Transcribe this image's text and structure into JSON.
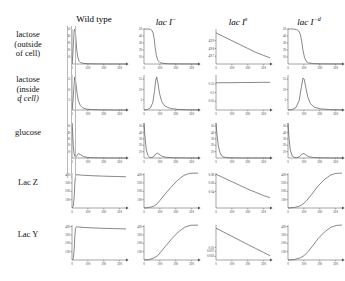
{
  "figure": {
    "columns": [
      {
        "label": "Wild type",
        "italic": false,
        "sup": ""
      },
      {
        "label": "lac I",
        "italic": true,
        "sup": "−"
      },
      {
        "label": "lac I",
        "italic": true,
        "sup": "s"
      },
      {
        "label": "lac I",
        "italic": true,
        "sup": "−d"
      }
    ],
    "rows": [
      {
        "lines": [
          "lactose",
          "(outside",
          "of cell)"
        ],
        "italic_line": -1
      },
      {
        "lines": [
          "lactose",
          "(inside",
          "ɖ cell)"
        ],
        "italic_line": 2
      },
      {
        "lines": [
          "glucose"
        ],
        "italic_line": -1
      },
      {
        "lines": [
          "Lac Z"
        ],
        "italic_line": -1
      },
      {
        "lines": [
          "Lac Y"
        ],
        "italic_line": -1
      }
    ],
    "xaxis": {
      "ticks": [
        100,
        200,
        300
      ],
      "min": 0,
      "max": 340
    },
    "colors": {
      "axis": "#4a4a4a",
      "curve": "#555555",
      "guide": "#b9b9b9"
    }
  },
  "chart_data": [
    {
      "type": "line",
      "row": "lactose (outside of cell)",
      "column": "Wild type",
      "title": "",
      "xlabel": "",
      "ylabel": "",
      "xlim": [
        0,
        340
      ],
      "ylim": [
        0,
        50
      ],
      "grid": false,
      "yticks": [
        10,
        20,
        30,
        40,
        50
      ],
      "xticks": [
        100,
        200,
        300
      ],
      "x": [
        0,
        5,
        10,
        14,
        18,
        22,
        26,
        30,
        36,
        44,
        55,
        70,
        100,
        160,
        230,
        300,
        340
      ],
      "y": [
        0,
        12,
        34,
        48,
        50,
        44,
        32,
        20,
        10,
        4.5,
        2,
        1,
        0.4,
        0.15,
        0.05,
        0.02,
        0.01
      ]
    },
    {
      "type": "line",
      "row": "lactose (outside of cell)",
      "column": "lac I−",
      "title": "",
      "xlabel": "",
      "ylabel": "",
      "xlim": [
        0,
        340
      ],
      "ylim": [
        0,
        50
      ],
      "grid": false,
      "yticks": [
        10,
        20,
        30,
        40,
        50
      ],
      "xticks": [
        100,
        200,
        300
      ],
      "x": [
        0,
        10,
        25,
        40,
        50,
        58,
        64,
        70,
        78,
        88,
        100,
        120,
        160,
        230,
        300,
        340
      ],
      "y": [
        50,
        50,
        50,
        49.5,
        48,
        44,
        36,
        24,
        12,
        5,
        2,
        0.8,
        0.3,
        0.1,
        0.05,
        0.02
      ]
    },
    {
      "type": "line",
      "row": "lactose (outside of cell)",
      "column": "lac I s",
      "title": "",
      "xlabel": "",
      "ylabel": "",
      "xlim": [
        0,
        340
      ],
      "ylim": [
        49.6,
        50.05
      ],
      "grid": false,
      "yticks": [
        49.7,
        49.8,
        49.9
      ],
      "xticks": [
        100,
        200,
        300
      ],
      "x": [
        0,
        50,
        100,
        150,
        200,
        250,
        300,
        340
      ],
      "y": [
        50.0,
        49.95,
        49.9,
        49.85,
        49.8,
        49.75,
        49.71,
        49.68
      ]
    },
    {
      "type": "line",
      "row": "lactose (outside of cell)",
      "column": "lac I −d",
      "title": "",
      "xlabel": "",
      "ylabel": "",
      "xlim": [
        0,
        340
      ],
      "ylim": [
        0,
        50
      ],
      "grid": false,
      "yticks": [
        10,
        20,
        30,
        40,
        50
      ],
      "xticks": [
        100,
        200,
        300
      ],
      "x": [
        0,
        15,
        35,
        55,
        68,
        78,
        86,
        94,
        104,
        116,
        130,
        160,
        210,
        270,
        340
      ],
      "y": [
        50,
        50,
        50,
        49,
        47,
        42,
        33,
        20,
        9,
        3.5,
        1.5,
        0.6,
        0.2,
        0.08,
        0.03
      ]
    },
    {
      "type": "line",
      "row": "lactose (inside of cell)",
      "column": "Wild type",
      "title": "",
      "xlabel": "",
      "ylabel": "",
      "xlim": [
        0,
        340
      ],
      "ylim": [
        0,
        17
      ],
      "grid": false,
      "yticks": [
        5,
        10,
        15
      ],
      "xticks": [
        100,
        200,
        300
      ],
      "x": [
        0,
        6,
        12,
        17,
        21,
        26,
        32,
        40,
        52,
        68,
        90,
        130,
        190,
        260,
        340
      ],
      "y": [
        0,
        4,
        11,
        16,
        15,
        12,
        8,
        4.5,
        2.2,
        1.0,
        0.45,
        0.18,
        0.07,
        0.03,
        0.01
      ]
    },
    {
      "type": "line",
      "row": "lactose (inside of cell)",
      "column": "lac I−",
      "title": "",
      "xlabel": "",
      "ylabel": "",
      "xlim": [
        0,
        340
      ],
      "ylim": [
        0,
        17
      ],
      "grid": false,
      "yticks": [
        5,
        10,
        15
      ],
      "xticks": [
        100,
        200,
        300
      ],
      "x": [
        0,
        20,
        40,
        55,
        66,
        74,
        80,
        88,
        98,
        112,
        130,
        160,
        210,
        270,
        340
      ],
      "y": [
        0,
        0.2,
        1.0,
        3.5,
        9,
        14.5,
        16,
        13,
        8,
        4,
        2,
        0.9,
        0.3,
        0.12,
        0.05
      ]
    },
    {
      "type": "line",
      "row": "lactose (inside of cell)",
      "column": "lac I s",
      "title": "",
      "xlabel": "",
      "ylabel": "",
      "xlim": [
        0,
        340
      ],
      "ylim": [
        0,
        0.2
      ],
      "grid": false,
      "yticks": [
        0.05,
        0.1,
        0.15
      ],
      "xticks": [
        100,
        200,
        300
      ],
      "x": [
        0,
        40,
        100,
        160,
        220,
        280,
        340
      ],
      "y": [
        0.155,
        0.156,
        0.156,
        0.157,
        0.157,
        0.158,
        0.158
      ]
    },
    {
      "type": "line",
      "row": "lactose (inside of cell)",
      "column": "lac I −d",
      "title": "",
      "xlabel": "",
      "ylabel": "",
      "xlim": [
        0,
        340
      ],
      "ylim": [
        0,
        17
      ],
      "grid": false,
      "yticks": [
        5,
        10,
        15
      ],
      "xticks": [
        100,
        200,
        300
      ],
      "x": [
        0,
        25,
        50,
        70,
        84,
        94,
        102,
        112,
        124,
        140,
        165,
        205,
        260,
        340
      ],
      "y": [
        0,
        0.2,
        1.2,
        4.5,
        11,
        15.5,
        15,
        11,
        6.5,
        3.2,
        1.4,
        0.55,
        0.2,
        0.07
      ]
    },
    {
      "type": "line",
      "row": "glucose",
      "column": "Wild type",
      "title": "",
      "xlabel": "",
      "ylabel": "",
      "xlim": [
        0,
        340
      ],
      "ylim": [
        0,
        55
      ],
      "grid": false,
      "yticks": [
        10,
        20,
        30,
        40,
        50
      ],
      "xticks": [
        100,
        200,
        300
      ],
      "x": [
        0,
        4,
        8,
        12,
        18,
        24,
        30,
        40,
        55,
        75,
        100,
        140,
        200,
        270,
        340
      ],
      "y": [
        55,
        40,
        20,
        8,
        2.5,
        1.2,
        3.5,
        7,
        5,
        2,
        0.8,
        0.3,
        0.1,
        0.05,
        0.02
      ]
    },
    {
      "type": "line",
      "row": "glucose",
      "column": "lac I−",
      "title": "",
      "xlabel": "",
      "ylabel": "",
      "xlim": [
        0,
        340
      ],
      "ylim": [
        0,
        55
      ],
      "grid": false,
      "yticks": [
        10,
        20,
        30,
        40,
        50
      ],
      "xticks": [
        100,
        200,
        300
      ],
      "x": [
        0,
        6,
        14,
        24,
        36,
        50,
        62,
        74,
        86,
        100,
        118,
        145,
        190,
        260,
        340
      ],
      "y": [
        55,
        34,
        14,
        4,
        1.2,
        0.6,
        2.5,
        6.5,
        7.5,
        5,
        2.2,
        0.9,
        0.3,
        0.1,
        0.04
      ]
    },
    {
      "type": "line",
      "row": "glucose",
      "column": "lac I s",
      "title": "",
      "xlabel": "",
      "ylabel": "",
      "xlim": [
        0,
        340
      ],
      "ylim": [
        0,
        55
      ],
      "grid": false,
      "yticks": [
        10,
        20,
        30,
        40,
        50
      ],
      "xticks": [
        100,
        200,
        300
      ],
      "x": [
        0,
        6,
        14,
        24,
        36,
        50,
        70,
        100,
        150,
        210,
        270,
        340
      ],
      "y": [
        55,
        38,
        20,
        9,
        3.5,
        1.4,
        0.6,
        0.25,
        0.1,
        0.05,
        0.02,
        0.01
      ]
    },
    {
      "type": "line",
      "row": "glucose",
      "column": "lac I −d",
      "title": "",
      "xlabel": "",
      "ylabel": "",
      "xlim": [
        0,
        340
      ],
      "ylim": [
        0,
        55
      ],
      "grid": false,
      "yticks": [
        10,
        20,
        30,
        40,
        50
      ],
      "xticks": [
        100,
        200,
        300
      ],
      "x": [
        0,
        6,
        14,
        26,
        40,
        56,
        72,
        86,
        100,
        114,
        132,
        160,
        205,
        270,
        340
      ],
      "y": [
        55,
        33,
        13,
        3.5,
        1.0,
        0.5,
        2.0,
        6.0,
        7.0,
        4.5,
        2.0,
        0.8,
        0.28,
        0.1,
        0.04
      ]
    },
    {
      "type": "line",
      "row": "Lac Z",
      "column": "Wild type",
      "title": "",
      "xlabel": "",
      "ylabel": "",
      "xlim": [
        0,
        340
      ],
      "ylim": [
        0,
        420
      ],
      "grid": false,
      "yticks": [
        100,
        200,
        300,
        400
      ],
      "xticks": [
        100,
        200,
        300
      ],
      "x": [
        0,
        8,
        14,
        18,
        22,
        28,
        40,
        70,
        120,
        200,
        280,
        340
      ],
      "y": [
        0,
        20,
        140,
        300,
        380,
        400,
        398,
        393,
        388,
        382,
        378,
        375
      ]
    },
    {
      "type": "line",
      "row": "Lac Z",
      "column": "lac I−",
      "title": "",
      "xlabel": "",
      "ylabel": "",
      "xlim": [
        0,
        340
      ],
      "ylim": [
        0,
        420
      ],
      "grid": false,
      "yticks": [
        100,
        200,
        300,
        400
      ],
      "xticks": [
        100,
        200,
        300
      ],
      "x": [
        0,
        30,
        60,
        80,
        100,
        130,
        170,
        210,
        250,
        285,
        310,
        340
      ],
      "y": [
        0,
        5,
        20,
        45,
        90,
        160,
        250,
        330,
        390,
        415,
        418,
        418
      ]
    },
    {
      "type": "line",
      "row": "Lac Z",
      "column": "lac I s",
      "title": "",
      "xlabel": "",
      "ylabel": "",
      "xlim": [
        0,
        340
      ],
      "ylim": [
        0,
        0.085
      ],
      "grid": false,
      "yticks": [
        0.04,
        0.06,
        0.08
      ],
      "xticks": [
        100,
        200,
        300
      ],
      "x": [
        0,
        50,
        100,
        150,
        200,
        250,
        300,
        340
      ],
      "y": [
        0.082,
        0.073,
        0.064,
        0.055,
        0.046,
        0.038,
        0.03,
        0.025
      ]
    },
    {
      "type": "line",
      "row": "Lac Z",
      "column": "lac I −d",
      "title": "",
      "xlabel": "",
      "ylabel": "",
      "xlim": [
        0,
        340
      ],
      "ylim": [
        0,
        420
      ],
      "grid": false,
      "yticks": [
        100,
        200,
        300,
        400
      ],
      "xticks": [
        100,
        200,
        300
      ],
      "x": [
        0,
        40,
        75,
        100,
        120,
        150,
        185,
        225,
        265,
        300,
        325,
        340
      ],
      "y": [
        0,
        6,
        25,
        55,
        95,
        165,
        255,
        335,
        392,
        415,
        418,
        418
      ]
    },
    {
      "type": "line",
      "row": "Lac Y",
      "column": "Wild type",
      "title": "",
      "xlabel": "",
      "ylabel": "",
      "xlim": [
        0,
        340
      ],
      "ylim": [
        0,
        420
      ],
      "grid": false,
      "yticks": [
        100,
        200,
        300,
        400
      ],
      "xticks": [
        100,
        200,
        300
      ],
      "x": [
        0,
        8,
        14,
        18,
        22,
        28,
        40,
        70,
        120,
        200,
        280,
        340
      ],
      "y": [
        0,
        18,
        130,
        295,
        378,
        398,
        396,
        391,
        386,
        380,
        376,
        373
      ]
    },
    {
      "type": "line",
      "row": "Lac Y",
      "column": "lac I−",
      "title": "",
      "xlabel": "",
      "ylabel": "",
      "xlim": [
        0,
        340
      ],
      "ylim": [
        0,
        420
      ],
      "grid": false,
      "yticks": [
        100,
        200,
        300,
        400
      ],
      "xticks": [
        100,
        200,
        300
      ],
      "x": [
        0,
        30,
        60,
        85,
        105,
        135,
        175,
        215,
        255,
        290,
        315,
        340
      ],
      "y": [
        0,
        5,
        22,
        50,
        95,
        165,
        255,
        335,
        392,
        415,
        418,
        418
      ]
    },
    {
      "type": "line",
      "row": "Lac Y",
      "column": "lac I s",
      "title": "",
      "xlabel": "",
      "ylabel": "",
      "xlim": [
        0,
        340
      ],
      "ylim": [
        0,
        0.028
      ],
      "grid": false,
      "yticks": [
        0.003,
        0.007,
        0.01
      ],
      "xticks": [
        100,
        200,
        300
      ],
      "x": [
        0,
        50,
        100,
        150,
        200,
        250,
        300,
        340
      ],
      "y": [
        0.0255,
        0.0222,
        0.019,
        0.0157,
        0.0124,
        0.0092,
        0.006,
        0.0035
      ]
    },
    {
      "type": "line",
      "row": "Lac Y",
      "column": "lac I −d",
      "title": "",
      "xlabel": "",
      "ylabel": "",
      "xlim": [
        0,
        340
      ],
      "ylim": [
        0,
        420
      ],
      "grid": false,
      "yticks": [
        100,
        200,
        300,
        400
      ],
      "xticks": [
        100,
        200,
        300
      ],
      "x": [
        0,
        40,
        78,
        105,
        125,
        155,
        190,
        230,
        270,
        305,
        328,
        340
      ],
      "y": [
        0,
        6,
        26,
        58,
        98,
        168,
        258,
        336,
        393,
        415,
        418,
        418
      ]
    }
  ]
}
